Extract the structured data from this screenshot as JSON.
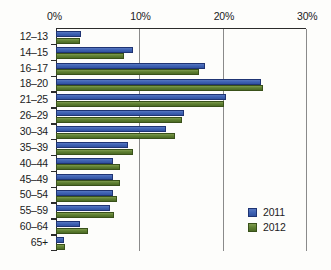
{
  "chart_data": {
    "type": "bar",
    "orientation": "horizontal",
    "title": "",
    "subtitle": "",
    "xlabel": "",
    "ylabel": "",
    "xlim": [
      0,
      30
    ],
    "ylim": null,
    "grid": true,
    "legend_position": "bottom-right",
    "xticks": [
      "0%",
      "10%",
      "20%",
      "30%"
    ],
    "xtick_values": [
      0,
      10,
      20,
      30
    ],
    "categories": [
      "12–13",
      "14–15",
      "16–17",
      "18–20",
      "21–25",
      "26–29",
      "30–34",
      "35–39",
      "40–44",
      "45–49",
      "50–54",
      "55–59",
      "60–64",
      "65+"
    ],
    "series": [
      {
        "name": "2011",
        "color": "#3f63b4",
        "values": [
          3.0,
          9.2,
          17.9,
          24.6,
          20.4,
          15.4,
          13.2,
          8.6,
          6.8,
          6.8,
          6.8,
          6.5,
          2.9,
          0.9
        ]
      },
      {
        "name": "2012",
        "color": "#5f8032",
        "values": [
          2.9,
          8.2,
          17.2,
          24.8,
          20.2,
          15.1,
          14.3,
          9.2,
          7.7,
          7.7,
          7.3,
          7.0,
          3.8,
          1.1
        ]
      }
    ],
    "legend": [
      "2011",
      "2012"
    ]
  }
}
